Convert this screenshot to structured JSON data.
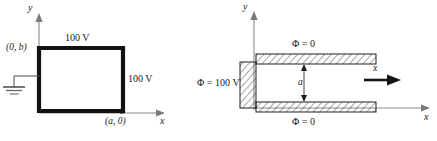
{
  "page": {
    "width": 437,
    "height": 141,
    "background": "#ffffff",
    "ink": "#1a1a1a"
  },
  "figure_left": {
    "name": "rectangular-box-100V",
    "description": "Grounded rectangular conducting trough in the x-y plane with 100 V electrodes",
    "axes": {
      "x_label": "x",
      "y_label": "y",
      "origin_label": ""
    },
    "labels": {
      "top_plate": "100 V",
      "right_plate": "100 V",
      "corner_top_left": "(0, b)",
      "corner_bottom_right": "(a, 0)"
    },
    "symbols": {
      "ground": "ground-symbol"
    }
  },
  "figure_right": {
    "name": "parallel-plate-waveguide",
    "description": "Semi-infinite parallel plate region with end plate at 100 V and plates at zero potential",
    "axes": {
      "x_label": "x",
      "y_label": "y"
    },
    "labels": {
      "top_plate": "Φ = 0",
      "bottom_plate": "Φ = 0",
      "end_plate": "Φ = 100 V",
      "gap_dimension": "a",
      "direction_arrow_label": "x"
    }
  }
}
